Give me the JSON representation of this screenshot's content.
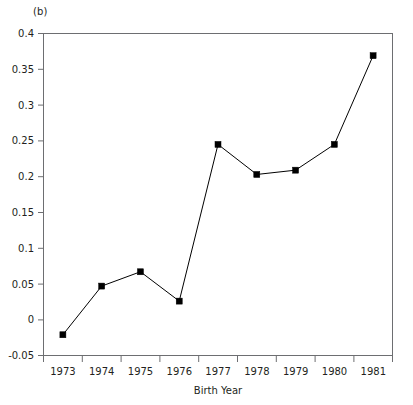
{
  "panel": {
    "label": "(b)"
  },
  "chart_data": {
    "type": "line",
    "title": "",
    "subtitle": "",
    "xlabel": "Birth Year",
    "ylabel": "",
    "categories": [
      "1973",
      "1974",
      "1975",
      "1976",
      "1977",
      "1978",
      "1979",
      "1980",
      "1981"
    ],
    "x": [
      1973,
      1974,
      1975,
      1976,
      1977,
      1978,
      1979,
      1980,
      1981
    ],
    "values": [
      -0.021,
      0.047,
      0.067,
      0.026,
      0.245,
      0.203,
      0.209,
      0.245,
      0.369
    ],
    "series": [
      {
        "name": "series-1",
        "values": [
          -0.021,
          0.047,
          0.067,
          0.026,
          0.245,
          0.203,
          0.209,
          0.245,
          0.369
        ],
        "marker": "square",
        "color": "#000000"
      }
    ],
    "xlim": [
      1972.5,
      1981.5
    ],
    "ylim": [
      -0.05,
      0.4
    ],
    "ytick_labels": [
      "0.4",
      "0.35",
      "0.3",
      "0.25",
      "0.2",
      "0.15",
      "0.1",
      "0.05",
      "0",
      "-0.05"
    ],
    "ytick_values": [
      0.4,
      0.35,
      0.3,
      0.25,
      0.2,
      0.15,
      0.1,
      0.05,
      0,
      -0.05
    ],
    "xtick_labels": [
      "1973",
      "1974",
      "1975",
      "1976",
      "1977",
      "1978",
      "1979",
      "1980",
      "1981"
    ],
    "grid": false,
    "legend": false,
    "legend_position": "none",
    "frame_color": "#6d6e71",
    "line_color": "#000000",
    "background": "#ffffff"
  }
}
